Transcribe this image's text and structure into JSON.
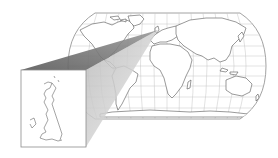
{
  "figure": {
    "colors": {
      "background": "#ffffff",
      "map_outline": "#8a8a8a",
      "graticule": "#bdbdbd",
      "coastline": "#555555",
      "wedge_dark": "#6e6e6e",
      "wedge_light": "#c9c9c9",
      "inset_border": "#8c8c8c"
    },
    "world_map": {
      "projection": "pseudo-cylindrical (Robinson-like)",
      "label": ""
    },
    "inset": {
      "region": "Great Britain",
      "label": ""
    }
  }
}
